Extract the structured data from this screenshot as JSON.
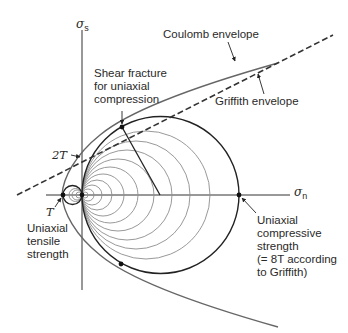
{
  "diagram": {
    "axes": {
      "vertical": {
        "symbol": "σ",
        "subscript": "s"
      },
      "horizontal": {
        "symbol": "σ",
        "subscript": "n"
      }
    },
    "labels": {
      "coulomb": "Coulomb envelope",
      "griffith": "Griffith envelope",
      "shear_fracture": "Shear fracture\nfor uniaxial\ncompression",
      "two_t": "2T",
      "t": "T",
      "tensile": "Uniaxial\ntensile\nstrength",
      "compressive": "Uniaxial\ncompressive\nstrength\n(= 8T according\nto Griffith)"
    },
    "colors": {
      "line": "#222222",
      "circle_light": "#8a8a8a",
      "envelope": "#555555"
    }
  }
}
